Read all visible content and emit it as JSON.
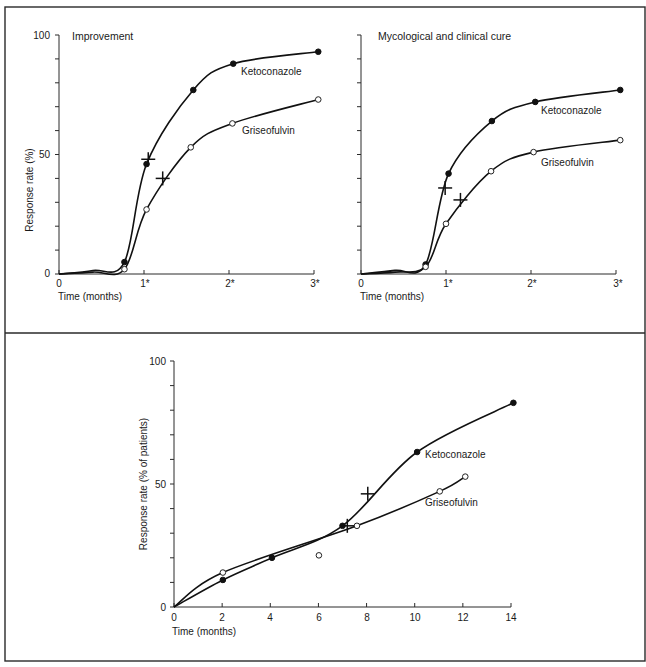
{
  "figure": {
    "panels": [
      {
        "id": "improvement",
        "title": "Improvement",
        "ylabel": "Response rate (%)",
        "xlabel": "Time (months)",
        "y_tick_labels": [
          "0",
          "50",
          "100"
        ],
        "x_tick_labels": [
          "0",
          "1*",
          "2*",
          "3*"
        ],
        "show_y_labels": true
      },
      {
        "id": "mycological-clinical-cure",
        "title": "Mycological and clinical cure",
        "ylabel": "",
        "xlabel": "Time (months)",
        "y_tick_labels": [],
        "x_tick_labels": [
          "0",
          "1*",
          "2*",
          "3*"
        ],
        "show_y_labels": false
      },
      {
        "id": "long-term",
        "title": "",
        "ylabel": "Response rate (% of patients)",
        "xlabel": "Time (months)",
        "y_tick_labels": [
          "0",
          "50",
          "100"
        ],
        "x_tick_labels": [
          "0",
          "2",
          "4",
          "6",
          "8",
          "10",
          "12",
          "14"
        ],
        "show_y_labels": true
      }
    ]
  },
  "chart_data": [
    {
      "type": "line",
      "title": "Improvement",
      "xlabel": "Time (months)",
      "ylabel": "Response rate (%)",
      "xlim": [
        0,
        3
      ],
      "ylim": [
        0,
        100
      ],
      "x_ticks": [
        "0",
        "1*",
        "2*",
        "3*"
      ],
      "y_ticks": [
        0,
        50,
        100
      ],
      "y_minor_step": 10,
      "grid": false,
      "legend": "inline labels",
      "series": [
        {
          "name": "Ketoconazole",
          "marker": "filled-circle",
          "x": [
            0.77,
            1.03,
            1.58,
            2.05,
            3.05
          ],
          "y": [
            5,
            46,
            77,
            88,
            93
          ],
          "median_marker": {
            "x": 1.05,
            "y": 48
          }
        },
        {
          "name": "Griseofulvin",
          "marker": "open-circle",
          "x": [
            0.77,
            1.03,
            1.55,
            2.04,
            3.05
          ],
          "y": [
            2,
            27,
            53,
            63,
            73
          ],
          "median_marker": {
            "x": 1.22,
            "y": 40
          }
        }
      ]
    },
    {
      "type": "line",
      "title": "Mycological and clinical cure",
      "xlabel": "Time (months)",
      "ylabel": "Response rate (%)",
      "xlim": [
        0,
        3
      ],
      "ylim": [
        0,
        100
      ],
      "x_ticks": [
        "0",
        "1*",
        "2*",
        "3*"
      ],
      "y_ticks": [
        0,
        50,
        100
      ],
      "y_minor_step": 10,
      "grid": false,
      "legend": "inline labels",
      "series": [
        {
          "name": "Ketoconazole",
          "marker": "filled-circle",
          "x": [
            0.76,
            1.03,
            1.54,
            2.05,
            3.05
          ],
          "y": [
            4,
            42,
            64,
            72,
            77
          ],
          "median_marker": {
            "x": 0.99,
            "y": 36
          }
        },
        {
          "name": "Griseofulvin",
          "marker": "open-circle",
          "x": [
            0.76,
            1.0,
            1.53,
            2.03,
            3.05
          ],
          "y": [
            3,
            21,
            43,
            51,
            56
          ],
          "median_marker": {
            "x": 1.17,
            "y": 31
          }
        }
      ]
    },
    {
      "type": "line",
      "title": "",
      "xlabel": "Time (months)",
      "ylabel": "Response rate (% of patients)",
      "xlim": [
        0,
        14
      ],
      "ylim": [
        0,
        100
      ],
      "x_ticks": [
        0,
        2,
        4,
        6,
        8,
        10,
        12,
        14
      ],
      "y_ticks": [
        0,
        50,
        100
      ],
      "y_minor_step": 10,
      "grid": false,
      "legend": "inline labels",
      "series": [
        {
          "name": "Ketoconazole",
          "marker": "filled-circle",
          "x": [
            2.03,
            4.07,
            7.0,
            10.1,
            14.1
          ],
          "y": [
            11,
            20,
            33,
            63,
            83
          ],
          "median_marker": {
            "x": 8.05,
            "y": 46
          }
        },
        {
          "name": "Griseofulvin",
          "marker": "open-circle",
          "x": [
            2.03,
            6.02,
            7.6,
            11.04,
            12.1
          ],
          "y": [
            14,
            21,
            33,
            47,
            53
          ],
          "median_marker": {
            "x": 7.2,
            "y": 33
          }
        }
      ]
    }
  ]
}
